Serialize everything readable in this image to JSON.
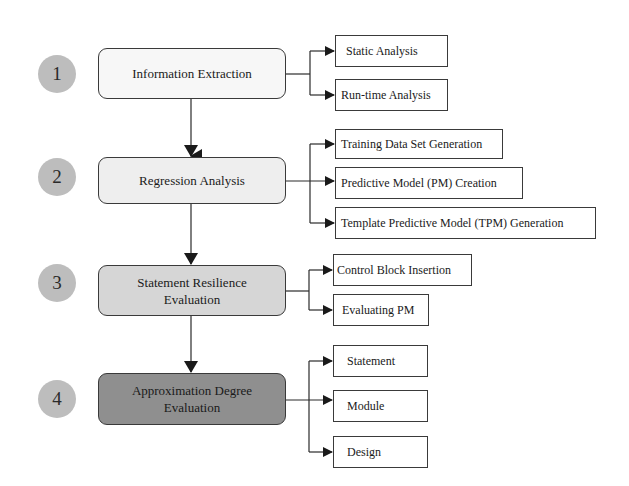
{
  "diagram": {
    "steps": [
      {
        "number": "1",
        "label": "Information Extraction",
        "fill": "#f7f7f7",
        "children": [
          "Static Analysis",
          "Run-time Analysis"
        ]
      },
      {
        "number": "2",
        "label": "Regression Analysis",
        "fill": "#eeeeee",
        "children": [
          "Training Data Set Generation",
          "Predictive Model (PM) Creation",
          "Template Predictive Model (TPM) Generation"
        ]
      },
      {
        "number": "3",
        "label": "Statement Resilience Evaluation",
        "label_lines": [
          "Statement Resilience",
          "Evaluation"
        ],
        "fill": "#d6d6d6",
        "children": [
          "Control Block Insertion",
          "Evaluating PM"
        ]
      },
      {
        "number": "4",
        "label": "Approximation Degree Evaluation",
        "label_lines": [
          "Approximation Degree",
          "Evaluation"
        ],
        "fill": "#8f8f8f",
        "children": [
          "Statement",
          "Module",
          "Design"
        ]
      }
    ],
    "colors": {
      "circle": "#bdbdbd",
      "line": "#2a2a2a"
    }
  }
}
